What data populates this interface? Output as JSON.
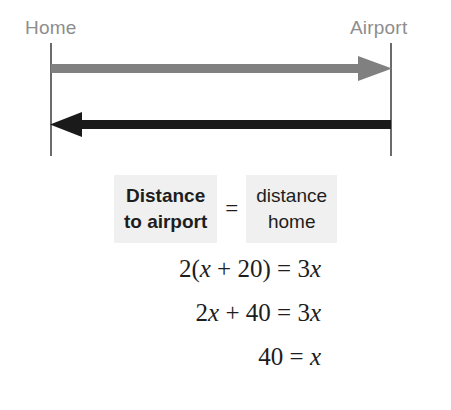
{
  "diagram": {
    "left_label": "Home",
    "right_label": "Airport",
    "arrow_to_airport": {
      "icon": "arrow-right-icon",
      "direction": "right",
      "color": "#808080"
    },
    "arrow_to_home": {
      "icon": "arrow-left-icon",
      "direction": "left",
      "color": "#1a1a1a"
    },
    "endpoint_line_color": "#6b6b6b",
    "label_color": "#8d8d8d"
  },
  "word_equation": {
    "left": {
      "line1": "Distance",
      "line2": "to airport"
    },
    "equals": "=",
    "right": {
      "line1": "distance",
      "line2": "home"
    },
    "box_background": "#f0f0f0"
  },
  "equation_steps": [
    {
      "id": "step-1",
      "text": "2(x + 20) = 3x",
      "parts": [
        "2(",
        "x",
        " + 20) = 3",
        "x"
      ]
    },
    {
      "id": "step-2",
      "text": "2x + 40 = 3x",
      "parts": [
        "2",
        "x",
        " + 40 = 3",
        "x"
      ]
    },
    {
      "id": "step-3",
      "text": "40 = x",
      "parts": [
        "40 = ",
        "x"
      ]
    }
  ],
  "step_text": {
    "s1_a": "2(",
    "s1_x1": "x",
    "s1_b": " + 20) = 3",
    "s1_x2": "x",
    "s2_a": "2",
    "s2_x1": "x",
    "s2_b": " + 40 = 3",
    "s2_x2": "x",
    "s3_a": "40 = ",
    "s3_x1": "x"
  }
}
